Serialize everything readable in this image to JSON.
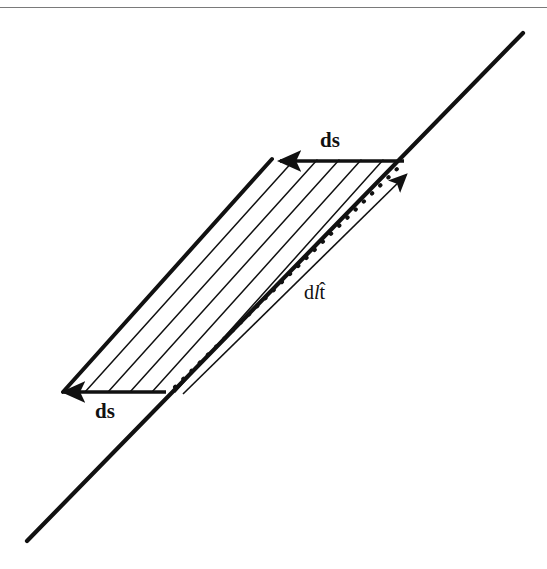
{
  "figure": {
    "kind": "vector-line-diagram",
    "background_color": "#ffffff",
    "stroke_color": "#111111",
    "top_rule": {
      "present": true,
      "color": "#7a7a7a"
    },
    "labels": [
      {
        "id": "ds-top",
        "name": "ds-label-top",
        "text": "ds",
        "style": "bold",
        "x": 330,
        "y": 147
      },
      {
        "id": "ds-bottom",
        "name": "ds-label-bottom",
        "text": "ds",
        "style": "bold",
        "x": 105,
        "y": 418
      }
    ],
    "vector_label": {
      "id": "dl-that",
      "name": "dl-t-hat-label",
      "prefix": "d",
      "italic_part": "l",
      "unit_vector": "t",
      "accent": "hat",
      "full_text": "dl t̂",
      "x": 315,
      "y": 299
    },
    "main_line": {
      "name": "inclined-baseline",
      "x1": 27,
      "y1": 541,
      "x2": 523,
      "y2": 33,
      "stroke_width": 4.2
    },
    "parallelogram": {
      "name": "swept-area-parallelogram",
      "vertices": [
        {
          "label": "top-left",
          "x": 272,
          "y": 159
        },
        {
          "label": "top-right",
          "x": 404,
          "y": 161
        },
        {
          "label": "bottom-right",
          "x": 183,
          "y": 394
        },
        {
          "label": "bottom-left",
          "x": 63,
          "y": 392
        }
      ]
    },
    "ds_arrows": [
      {
        "name": "ds-arrow-top",
        "direction": "left",
        "tail_x": 404,
        "tail_y": 161,
        "tip_x": 276,
        "tip_y": 161,
        "stroke_width": 3.4
      },
      {
        "name": "ds-arrow-bottom",
        "direction": "left",
        "tail_x": 166,
        "tail_y": 392,
        "tip_x": 60,
        "tip_y": 392,
        "stroke_width": 3.4
      }
    ],
    "dl_arrow": {
      "name": "dl-t-hat-arrow",
      "tail_x": 183,
      "tail_y": 394,
      "tip_x": 413,
      "tip_y": 168,
      "stroke_width": 1.6,
      "arrowhead": "filled-triangle"
    },
    "hatch_lines": {
      "name": "hatch-line-group",
      "count": 5,
      "stroke_width": 1.5,
      "orientation": "parallel-to-baseline"
    },
    "dotted_line": {
      "name": "dotted-diagonal",
      "x1": 175,
      "y1": 387,
      "x2": 400,
      "y2": 166,
      "dot_radius": 2.0,
      "dash_pattern": "0.5 11"
    },
    "thick_edges": [
      {
        "name": "parallelogram-left-edge",
        "x1": 63,
        "y1": 392,
        "x2": 272,
        "y2": 159,
        "stroke_width": 4.0
      }
    ]
  }
}
